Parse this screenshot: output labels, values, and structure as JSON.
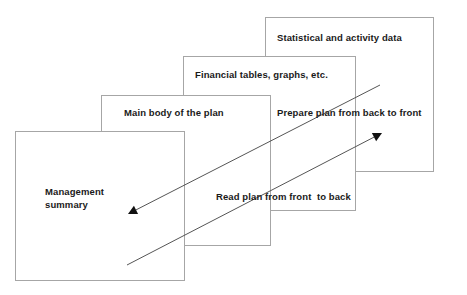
{
  "diagram": {
    "background_color": "#ffffff",
    "border_color": "#a6a6a6",
    "text_color": "#1a1a1a",
    "arrow_color": "#555555",
    "cards": [
      {
        "id": "statistical",
        "label": "Statistical and activity data",
        "x": 265,
        "y": 17,
        "w": 169,
        "h": 155,
        "label_x": 277,
        "label_y": 31,
        "layer": 4
      },
      {
        "id": "financial",
        "label": "Financial tables, graphs, etc.",
        "x": 183,
        "y": 56,
        "w": 173,
        "h": 155,
        "label_x": 195,
        "label_y": 68,
        "layer": 3
      },
      {
        "id": "mainbody",
        "label": "Main body of the plan",
        "x": 101,
        "y": 95,
        "w": 170,
        "h": 151,
        "label_x": 124,
        "label_y": 106,
        "layer": 2
      },
      {
        "id": "management",
        "label": "Management\nsummary",
        "x": 15,
        "y": 131,
        "w": 170,
        "h": 150,
        "label_x": 45,
        "label_y": 185,
        "layer": 1
      }
    ],
    "arrows": [
      {
        "id": "read-front-to-back",
        "label": "Read plan from front  to back",
        "label_x": 216,
        "label_y": 190,
        "from_x": 380,
        "from_y": 85,
        "to_x": 128,
        "to_y": 214,
        "direction": "down-left"
      },
      {
        "id": "prepare-back-to-front",
        "label": "Prepare plan from back to front",
        "label_x": 277,
        "label_y": 106,
        "from_x": 127,
        "from_y": 265,
        "to_x": 382,
        "to_y": 133,
        "direction": "up-right"
      }
    ]
  }
}
